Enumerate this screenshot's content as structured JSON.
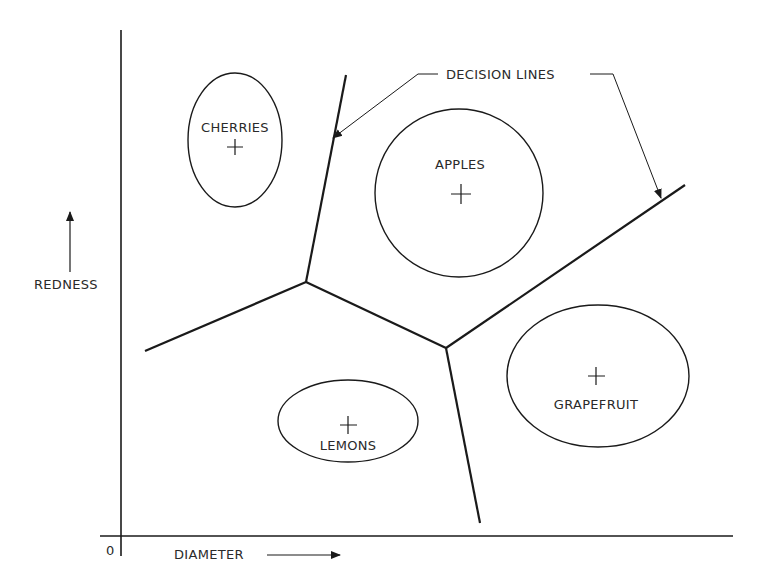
{
  "diagram": {
    "axes": {
      "x_label": "DIAMETER",
      "y_label": "REDNESS",
      "origin_label": "0"
    },
    "callout": "DECISION LINES",
    "classes": [
      {
        "name": "CHERRIES",
        "label": "CHERRIES"
      },
      {
        "name": "APPLES",
        "label": "APPLES"
      },
      {
        "name": "LEMONS",
        "label": "LEMONS"
      },
      {
        "name": "GRAPEFRUIT",
        "label": "GRAPEFRUIT"
      }
    ],
    "colors": {
      "ink": "#1a1a1a",
      "background": "#ffffff"
    }
  }
}
